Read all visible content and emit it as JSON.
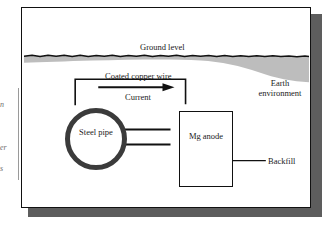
{
  "figure": {
    "type": "cathodic-protection-diagram",
    "frame": {
      "border_color": "#111111",
      "shadow_color": "#5d5d5d",
      "background": "#ffffff"
    },
    "labels": {
      "ground_level": "Ground level",
      "coated_copper_wire": "Coated copper wire",
      "current": "Current",
      "earth_environment": "Earth environment",
      "backfill": "Backfill",
      "steel_pipe": "Steel pipe",
      "mg_anode": "Mg anode"
    },
    "components": {
      "steel_pipe": {
        "shape": "annulus",
        "wall_color": "#3b3b3b",
        "fill": "#ffffff"
      },
      "mg_anode": {
        "shape": "rectangle",
        "stroke": "#111111",
        "fill": "#ffffff"
      },
      "soil": {
        "fill": "#b9b9b9",
        "surface": "wavy-line"
      },
      "wire": {
        "stroke": "#111111",
        "path": "bracket"
      }
    },
    "arrows": {
      "current_direction": "right",
      "electron_flow_to_pipe": "left",
      "electron_flow_count": 2,
      "backfill_pointer": "left"
    }
  },
  "margin_text": {
    "fragment_1": "n",
    "fragment_2": "er",
    "fragment_3": "s"
  }
}
